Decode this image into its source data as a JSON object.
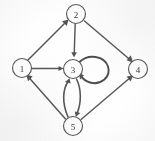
{
  "diagram": {
    "type": "directed-graph",
    "background_color": "#fefefe",
    "node_stroke_color": "#5a5a5a",
    "edge_color": "#585858",
    "label_color": "#3a3a3a",
    "node_radius": 9.5,
    "nodes": [
      {
        "id": "1",
        "label": "1",
        "cx": 22,
        "cy": 68
      },
      {
        "id": "2",
        "label": "2",
        "cx": 76,
        "cy": 14
      },
      {
        "id": "3",
        "label": "3",
        "cx": 73,
        "cy": 69
      },
      {
        "id": "4",
        "label": "4",
        "cx": 138,
        "cy": 69
      },
      {
        "id": "5",
        "label": "5",
        "cx": 73,
        "cy": 126
      }
    ],
    "edges": [
      {
        "from": "1",
        "to": "2",
        "shape": "straight",
        "directed": true
      },
      {
        "from": "1",
        "to": "3",
        "shape": "straight",
        "directed": true
      },
      {
        "from": "2",
        "to": "3",
        "shape": "straight",
        "directed": true
      },
      {
        "from": "2",
        "to": "4",
        "shape": "straight",
        "directed": true
      },
      {
        "from": "5",
        "to": "1",
        "shape": "straight",
        "directed": true
      },
      {
        "from": "5",
        "to": "4",
        "shape": "straight",
        "directed": true
      },
      {
        "from": "5",
        "to": "3",
        "shape": "curved",
        "directed": true
      },
      {
        "from": "3",
        "to": "5",
        "shape": "curved",
        "directed": true
      },
      {
        "from": "3",
        "to": "3",
        "shape": "self-loop",
        "directed": true
      }
    ],
    "edge_count": 9,
    "node_count": 5,
    "has_self_loop": true,
    "self_loop_node": "3",
    "bidirectional_pairs": [
      [
        "3",
        "5"
      ]
    ]
  }
}
